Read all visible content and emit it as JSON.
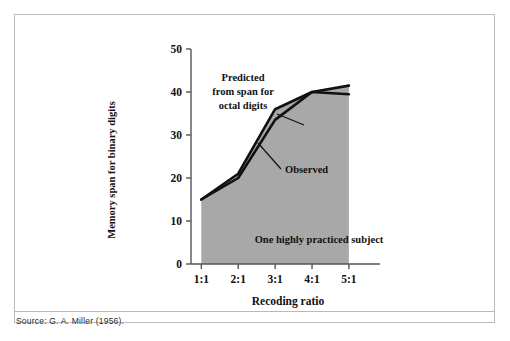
{
  "figure": {
    "source_note": "Source: G. A. Miller (1956).",
    "inline_annotation": "One highly practiced subject",
    "label_predicted": [
      "Predicted",
      "from span for",
      "octal digits"
    ],
    "label_observed": "Observed"
  },
  "chart_data": {
    "type": "line",
    "title": "",
    "xlabel": "Recoding ratio",
    "ylabel": "Memory span for binary digits",
    "categories": [
      "1:1",
      "2:1",
      "3:1",
      "4:1",
      "5:1"
    ],
    "x": [
      1,
      2,
      3,
      4,
      5
    ],
    "xlim": [
      0.72,
      5.3
    ],
    "ylim": [
      0,
      50
    ],
    "yticks": [
      0,
      10,
      20,
      30,
      40,
      50
    ],
    "ytick_labels": [
      "0",
      "10",
      "20",
      "30",
      "40",
      "50"
    ],
    "grid": false,
    "legend": "inline-annotations",
    "fill": "area-under-observed",
    "colors": {
      "area": "#a8a8a8",
      "line": "#111111",
      "axis": "#555555"
    },
    "series": [
      {
        "name": "Predicted from span for octal digits",
        "values": [
          15,
          21,
          36,
          40,
          41.5
        ]
      },
      {
        "name": "Observed",
        "values": [
          15,
          20,
          33.5,
          40,
          39.5
        ]
      }
    ],
    "annotations": [
      {
        "text": "One highly practiced subject",
        "x": 3.3,
        "y": 5
      }
    ]
  }
}
